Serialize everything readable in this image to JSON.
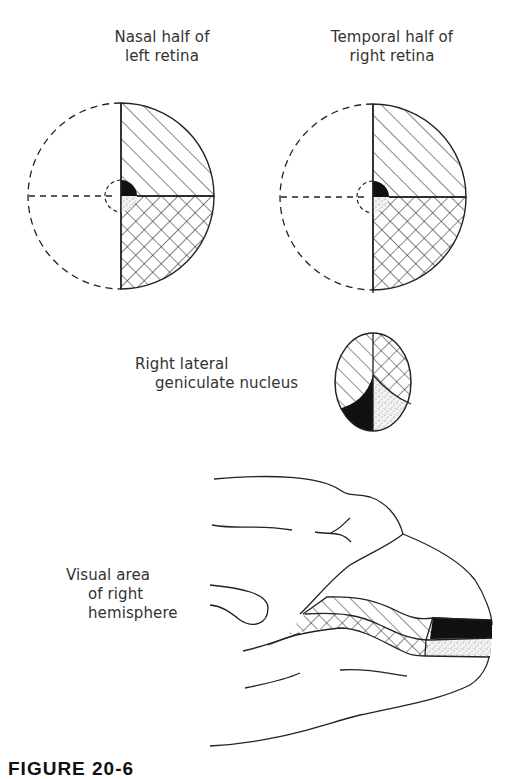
{
  "labels": {
    "nasal_left_retina": [
      "Nasal half of",
      "left retina"
    ],
    "temporal_right_retina": [
      "Temporal half of",
      "right retina"
    ],
    "lgn": [
      "Right lateral",
      "geniculate nucleus"
    ],
    "visual_area": [
      "Visual area",
      "of right",
      "hemisphere"
    ]
  },
  "caption": "FIGURE 20-6",
  "diagram": {
    "nodes": [
      {
        "id": "left-retina",
        "label": "Nasal half of left retina",
        "shape": "circle",
        "center": [
          121,
          196
        ],
        "radius": 93
      },
      {
        "id": "right-retina",
        "label": "Temporal half of right retina",
        "shape": "circle",
        "center": [
          373,
          197
        ],
        "radius": 93
      },
      {
        "id": "lgn",
        "label": "Right lateral geniculate nucleus",
        "shape": "ellipse",
        "center": [
          373,
          382
        ],
        "rx": 38,
        "ry": 49
      },
      {
        "id": "visual-cortex",
        "label": "Visual area of right hemisphere",
        "shape": "brain-outline"
      }
    ],
    "regions": [
      {
        "name": "upper-quadrant",
        "pattern": "diagonal-hatch"
      },
      {
        "name": "lower-quadrant",
        "pattern": "cross-hatch"
      },
      {
        "name": "macula-upper",
        "pattern": "solid-black"
      },
      {
        "name": "macula-lower",
        "pattern": "stipple"
      }
    ],
    "colors": {
      "ink": "#222222",
      "background": "#ffffff",
      "stipple": "#9a9a9a"
    }
  }
}
